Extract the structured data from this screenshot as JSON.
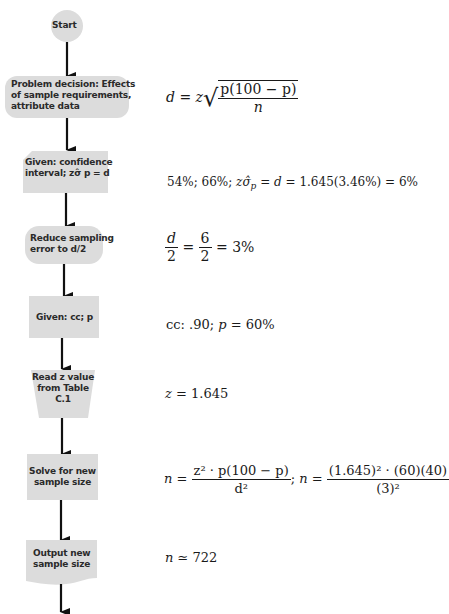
{
  "flowchart": {
    "nodes": [
      {
        "id": "start",
        "shape": "circle",
        "lines": [
          "Start"
        ]
      },
      {
        "id": "problem",
        "shape": "rounded-rect",
        "lines": [
          "Problem decision:  Effects",
          "of sample requirements,",
          "attribute data"
        ]
      },
      {
        "id": "given-ci",
        "shape": "card",
        "lines": [
          "Given: confidence",
          "interval; zσ̂ p = d"
        ]
      },
      {
        "id": "reduce",
        "shape": "rounded-rect",
        "lines": [
          "Reduce sampling",
          "error to d/2"
        ]
      },
      {
        "id": "given-cc",
        "shape": "rect",
        "lines": [
          "Given:  cc; p"
        ]
      },
      {
        "id": "read-z",
        "shape": "trapezoid",
        "lines": [
          "Read z value",
          "from Table",
          "C.1"
        ]
      },
      {
        "id": "solve",
        "shape": "rect",
        "lines": [
          "Solve for new",
          "sample size"
        ]
      },
      {
        "id": "output",
        "shape": "document",
        "lines": [
          "Output new",
          "sample size"
        ]
      }
    ],
    "fill_color": "#dcdcdc",
    "arrow_color": "#111111"
  },
  "equations": {
    "eq1": {
      "lhs": "d = z",
      "sqrt_num": "p(100 − p)",
      "sqrt_den": "n"
    },
    "eq2": {
      "text_a": "54%; 66%; ",
      "z": "z",
      "sigma": "σ̂",
      "sub": "p",
      "text_b": " = ",
      "d": "d",
      "text_c": " = 1.645(3.46%) = 6%"
    },
    "eq3": {
      "num1": "d",
      "den1": "2",
      "eq": " = ",
      "num2": "6",
      "den2": "2",
      "rest": " = 3%"
    },
    "eq4": {
      "text_a": "cc: .90; ",
      "p": "p",
      "text_b": " = 60%"
    },
    "eq5": {
      "z": "z",
      "text": " = 1.645"
    },
    "eq6": {
      "n1": "n",
      "eq1": " = ",
      "num1": "z² · p(100 − p)",
      "den1": "d²",
      "sep": "; ",
      "n2": "n",
      "eq2": " = ",
      "num2": "(1.645)² · (60)(40)",
      "den2": "(3)²"
    },
    "eq7": {
      "n": "n",
      "text": " ≃ 722"
    }
  }
}
